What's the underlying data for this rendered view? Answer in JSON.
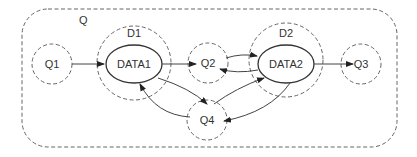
{
  "diagram": {
    "container": {
      "label": "Q"
    },
    "nodes": {
      "q1": {
        "label": "Q1"
      },
      "d1": {
        "label": "D1"
      },
      "data1": {
        "label": "DATA1"
      },
      "q2": {
        "label": "Q2"
      },
      "d2": {
        "label": "D2"
      },
      "data2": {
        "label": "DATA2"
      },
      "q3": {
        "label": "Q3"
      },
      "q4": {
        "label": "Q4"
      }
    },
    "edges": [
      {
        "from": "Q1",
        "to": "DATA1"
      },
      {
        "from": "DATA1",
        "to": "Q2"
      },
      {
        "from": "Q2",
        "to": "DATA2"
      },
      {
        "from": "DATA2",
        "to": "Q2"
      },
      {
        "from": "DATA2",
        "to": "Q3"
      },
      {
        "from": "DATA1",
        "to": "Q4"
      },
      {
        "from": "Q4",
        "to": "DATA1"
      },
      {
        "from": "Q4",
        "to": "DATA2"
      },
      {
        "from": "DATA2",
        "to": "Q4"
      }
    ],
    "colors": {
      "stroke": "#444444",
      "dashed": "#666666",
      "text": "#333333"
    }
  }
}
